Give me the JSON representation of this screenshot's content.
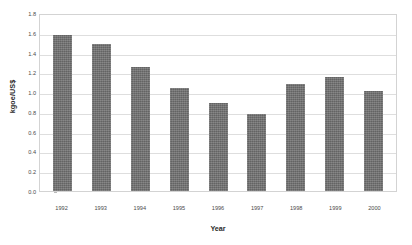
{
  "chart_data": {
    "type": "bar",
    "title": "",
    "subtitle": "",
    "xlabel": "Year",
    "ylabel": "kgoe/US$",
    "categories": [
      "1992",
      "1993",
      "1994",
      "1995",
      "1996",
      "1997",
      "1998",
      "1999",
      "2000"
    ],
    "values": [
      1.58,
      1.49,
      1.25,
      1.04,
      0.89,
      0.78,
      1.08,
      1.15,
      1.01
    ],
    "series": [
      {
        "name": "Energy intensity",
        "values": [
          1.58,
          1.49,
          1.25,
          1.04,
          0.89,
          0.78,
          1.08,
          1.15,
          1.01
        ]
      }
    ],
    "ylim": [
      0.0,
      1.8
    ],
    "ytick_labels": [
      "1.8",
      "1.6",
      "1.4",
      "1.2",
      "1.0",
      "0.8",
      "0.6",
      "0.4",
      "0.2",
      "0.0"
    ],
    "ytick_values": [
      1.8,
      1.6,
      1.4,
      1.2,
      1.0,
      0.8,
      0.6,
      0.4,
      0.2,
      0.0
    ],
    "ytick_step": 0.2,
    "grid": true,
    "grid_axis": "y",
    "legend": false,
    "legend_position": "none",
    "annotations": [],
    "colors": {
      "bar": "#6f6f6f",
      "gridline": "#dedede",
      "plot_border": "#d3d3d3",
      "plot_background": "#ffffff",
      "figure_background": "#ffffff",
      "tick_label": "#4a4a4a",
      "axis_title": "#2b2b2b"
    }
  }
}
